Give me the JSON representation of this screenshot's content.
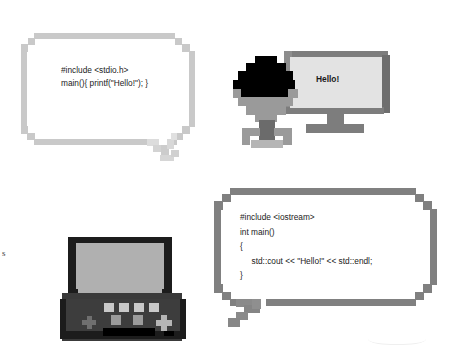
{
  "page": {
    "background_color": "#ffffff",
    "width": 451,
    "height": 359
  },
  "colors": {
    "bubble_c_border": "#c9c9c9",
    "bubble_cpp_border": "#808080",
    "bubble_fill": "#ffffff",
    "text": "#1a1a1a",
    "monitor_frame_dark": "#6e6e6e",
    "monitor_frame_mid": "#7d7d7d",
    "monitor_screen": "#e3e3e3",
    "figure_head": "#000000",
    "figure_body": "#9a9a9a",
    "figure_leg": "#6b6b6b",
    "figure_foot": "#b5b5b5",
    "console_shell": "#1c1c1c",
    "console_body": "#3a3a3a",
    "console_screen": "#b0b0b0",
    "console_button_light": "#c9c9c9",
    "console_button_mid": "#9b9b9b",
    "console_bar": "#000000"
  },
  "bubbles": [
    {
      "id": "bubble-c",
      "name": "c-code-speech-bubble",
      "language": "C",
      "border_color": "#c9c9c9",
      "tail_direction": "down-right",
      "code": "#include <stdio.h>\nmain(){ printf(\"Hello!\"); }",
      "lines": [
        "#include <stdio.h>",
        "main(){ printf(\"Hello!\"); }"
      ]
    },
    {
      "id": "bubble-cpp",
      "name": "cpp-code-speech-bubble",
      "language": "C++",
      "border_color": "#808080",
      "tail_direction": "down-left",
      "code": "#include <iostream>\nint main()\n{\n     std::cout << \"Hello!\" << std::endl;\n}",
      "lines": [
        "#include <iostream>",
        "int main()",
        "{",
        "      std::cout << \"Hello!\" << std::endl;",
        "}"
      ]
    }
  ],
  "monitor": {
    "name": "desktop-monitor",
    "screen_text": "Hello!"
  },
  "figure": {
    "name": "pixel-character"
  },
  "console": {
    "name": "handheld-game-console",
    "description": "pixel-art portable computer / game console with screen, four face buttons, two d-pads and a black bar",
    "button_count": 4,
    "dpad_count": 2,
    "mid_button_count": 2
  },
  "artifacts": {
    "left_margin_letter": "s"
  }
}
